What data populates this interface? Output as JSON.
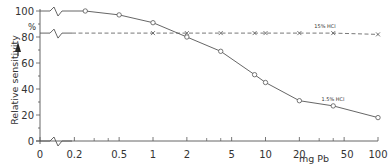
{
  "chart_data": {
    "type": "line",
    "title": "",
    "xlabel": "mg Pb",
    "ylabel": "Relative sensitivity",
    "y_unit": "%",
    "xscale": "log",
    "x_ticks": [
      "0",
      "0.2",
      "0.5",
      "1",
      "2",
      "5",
      "10",
      "20",
      "50",
      "100"
    ],
    "y_ticks": [
      "0",
      "20",
      "40",
      "60",
      "80",
      "100"
    ],
    "ylim": [
      0,
      100
    ],
    "grid": false,
    "axis_breaks": true,
    "series": [
      {
        "name": "1.5% HCl",
        "style": "solid",
        "marker": "circle",
        "x": [
          0.25,
          0.5,
          1,
          2,
          4,
          8,
          10,
          20,
          40,
          100
        ],
        "values": [
          100,
          97,
          91,
          80,
          69,
          51,
          45,
          31,
          27,
          18
        ]
      },
      {
        "name": "15% HCl",
        "style": "dashed",
        "marker": "x",
        "x": [
          1,
          2,
          4,
          8,
          10,
          20,
          40,
          100
        ],
        "values": [
          83,
          83,
          83,
          83,
          83,
          83,
          83,
          82
        ]
      }
    ]
  },
  "labels": {
    "ylabel": "Relative sensitivity",
    "yunit": "%",
    "xunit": "mg Pb",
    "series_a": "15% HCl",
    "series_b": "1.5% HCl"
  },
  "colors": {
    "line": "#555555",
    "text": "#333333"
  }
}
